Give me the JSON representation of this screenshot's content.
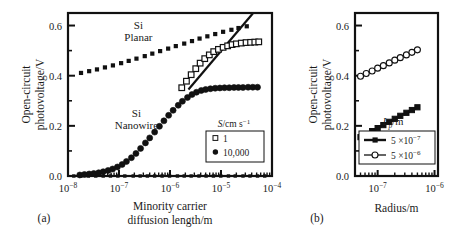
{
  "figure": {
    "panel_a_caption": "(a)",
    "panel_b_caption": "(b)"
  },
  "chart_data": [
    {
      "id": "panel-a",
      "type": "line",
      "title": "",
      "xlabel": "Minority carrier diffusion length/m",
      "xlabel_line1": "Minority carrier",
      "xlabel_line2": "diffusion length/m",
      "ylabel": "Open-circuit photovoltage/V",
      "ylabel_line1": "Open-circuit",
      "ylabel_line2": "photovoltage/V",
      "xscale": "log",
      "xlim": [
        1e-08,
        0.0001
      ],
      "ylim": [
        0.0,
        0.65
      ],
      "grid": false,
      "xticklabels": [
        "10−8",
        "10−7",
        "10−6",
        "10−5",
        "10−4"
      ],
      "xtickvalues": [
        1e-08,
        1e-07,
        1e-06,
        1e-05,
        0.0001
      ],
      "yticklabels": [
        "0.0",
        "0.2",
        "0.4",
        "0.6"
      ],
      "ytickvalues": [
        0.0,
        0.2,
        0.4,
        0.6
      ],
      "yminorticks": [
        0.1,
        0.3,
        0.5
      ],
      "annotations": [
        {
          "text_line1": "Si",
          "text_line2": "Planar",
          "x": 2.4e-07,
          "y": 0.585
        },
        {
          "text_line1": "Si",
          "text_line2": "Nanowire",
          "x": 2.2e-07,
          "y": 0.235
        }
      ],
      "legend": {
        "title": "S/cm s−1",
        "title_base": "S/cm s",
        "title_exp": "−1",
        "position": "lower-right",
        "entries": [
          {
            "label": "1",
            "marker": "open-square"
          },
          {
            "label": "10,000",
            "marker": "filled-circle"
          }
        ]
      },
      "series": [
        {
          "name": "Si Planar",
          "marker": "small-filled-square",
          "line": "none",
          "x": [
            1.8e-08,
            2.6e-08,
            3.7e-08,
            5.3e-08,
            7.6e-08,
            1.1e-07,
            1.55e-07,
            2.2e-07,
            3.2e-07,
            4.5e-07,
            6.4e-07,
            9.2e-07,
            1.3e-06,
            1.9e-06,
            2.7e-06,
            3.8e-06,
            5.4e-06,
            7.7e-06,
            1.1e-05,
            1.6e-05,
            2.2e-05,
            3.2e-05
          ],
          "y": [
            0.411,
            0.418,
            0.425,
            0.433,
            0.441,
            0.45,
            0.459,
            0.468,
            0.478,
            0.488,
            0.498,
            0.508,
            0.518,
            0.528,
            0.538,
            0.548,
            0.557,
            0.566,
            0.575,
            0.583,
            0.59,
            0.597
          ]
        },
        {
          "name": "S = 1",
          "marker": "open-square",
          "line": "none",
          "x": [
            1.7e-06,
            2.1e-06,
            2.6e-06,
            3.2e-06,
            3.9e-06,
            4.8e-06,
            5.9e-06,
            7.2e-06,
            8.9e-06,
            1.1e-05,
            1.35e-05,
            1.65e-05,
            2e-05,
            2.5e-05,
            3.1e-05,
            3.8e-05,
            4.6e-05,
            5.5e-05
          ],
          "y": [
            0.352,
            0.378,
            0.404,
            0.428,
            0.45,
            0.468,
            0.483,
            0.496,
            0.505,
            0.513,
            0.519,
            0.524,
            0.527,
            0.53,
            0.532,
            0.533,
            0.534,
            0.535
          ]
        },
        {
          "name": "S = 10,000",
          "marker": "filled-circle",
          "line": "none",
          "x": [
            1.7e-08,
            2.1e-08,
            2.6e-08,
            3.2e-08,
            4e-08,
            4.9e-08,
            6.1e-08,
            7.5e-08,
            9.3e-08,
            1.15e-07,
            1.4e-07,
            1.75e-07,
            2.15e-07,
            2.65e-07,
            3.3e-07,
            4e-07,
            5e-07,
            6.2e-07,
            7.6e-07,
            9.4e-07,
            1.15e-06,
            1.45e-06,
            1.75e-06,
            2.2e-06,
            2.7e-06,
            3.3e-06,
            4.1e-06,
            5e-06,
            6.2e-06,
            7.7e-06,
            9.5e-06,
            1.17e-05,
            1.45e-05,
            1.8e-05,
            2.2e-05,
            2.7e-05,
            3.4e-05,
            4.2e-05,
            5.2e-05
          ],
          "y": [
            0.004,
            0.006,
            0.008,
            0.01,
            0.013,
            0.017,
            0.022,
            0.028,
            0.036,
            0.046,
            0.058,
            0.073,
            0.09,
            0.11,
            0.132,
            0.152,
            0.175,
            0.198,
            0.22,
            0.242,
            0.262,
            0.282,
            0.298,
            0.313,
            0.325,
            0.334,
            0.341,
            0.345,
            0.348,
            0.35,
            0.351,
            0.352,
            0.352,
            0.353,
            0.353,
            0.353,
            0.354,
            0.354,
            0.354
          ]
        },
        {
          "name": "ideal-line",
          "marker": "none",
          "line": "solid",
          "x": [
            2.3e-06,
            4.2e-05
          ],
          "y": [
            0.345,
            0.648
          ]
        },
        {
          "name": "baseline",
          "marker": "small-filled-square",
          "line": "none",
          "x": [
            1.3e-08,
            1.8e-08,
            2.5e-08,
            3.5e-08,
            4.9e-08,
            6.8e-08,
            9.5e-08,
            1.3e-07,
            1.9e-07,
            2.6e-07,
            3.6e-07,
            5e-07,
            7e-07,
            9.8e-07,
            1.4e-06,
            1.9e-06,
            2.6e-06,
            3.7e-06,
            5.1e-06,
            7.1e-06,
            9.9e-06,
            1.4e-05,
            1.9e-05,
            2.7e-05,
            3.7e-05,
            5.2e-05,
            7.2e-05
          ],
          "y": [
            0.0,
            0.0,
            0.0,
            0.0,
            0.0,
            0.0,
            0.0,
            0.0,
            0.0,
            0.0,
            0.0,
            0.0,
            0.0,
            0.0,
            0.0,
            0.0,
            0.0,
            0.0,
            0.0,
            0.0,
            0.0,
            0.0,
            0.0,
            0.0,
            0.0,
            0.0,
            0.0
          ]
        }
      ]
    },
    {
      "id": "panel-b",
      "type": "line",
      "title": "",
      "xlabel": "Radius/m",
      "ylabel": "Open-circuit photovoltage/V",
      "ylabel_line1": "Open-circuit",
      "ylabel_line2": "photovoltage/V",
      "xscale": "log",
      "xlim": [
        4e-08,
        1.15e-06
      ],
      "ylim": [
        0.0,
        0.65
      ],
      "grid": false,
      "xticklabels": [
        "10−7",
        "10−6"
      ],
      "xtickvalues": [
        1e-07,
        1e-06
      ],
      "yticklabels": [
        "0.0",
        "0.2",
        "0.4",
        "0.6"
      ],
      "ytickvalues": [
        0.0,
        0.2,
        0.4,
        0.6
      ],
      "yminorticks": [
        0.1,
        0.3,
        0.5
      ],
      "legend": {
        "title": "Lp/m",
        "title_base": "L",
        "title_sub": "p",
        "title_suffix": "/m",
        "position": "lower-center",
        "entries": [
          {
            "label": "5 ×10−7",
            "marker": "filled-square",
            "base": "5 ×10",
            "exp": "−7"
          },
          {
            "label": "5 ×10−6",
            "marker": "open-circle",
            "base": "5 ×10",
            "exp": "−6"
          }
        ]
      },
      "series": [
        {
          "name": "5 ×10−6",
          "marker": "open-circle",
          "line": "solid-thin",
          "x": [
            5e-08,
            6.3e-08,
            8e-08,
            1e-07,
            1.26e-07,
            1.6e-07,
            2e-07,
            2.5e-07,
            3.2e-07,
            4e-07,
            5e-07
          ],
          "y": [
            0.398,
            0.409,
            0.419,
            0.43,
            0.44,
            0.451,
            0.462,
            0.472,
            0.483,
            0.493,
            0.503
          ]
        },
        {
          "name": "5 ×10−7",
          "marker": "filled-square",
          "line": "solid-thin",
          "x": [
            5e-08,
            6.3e-08,
            8e-08,
            1e-07,
            1.26e-07,
            1.6e-07,
            2e-07,
            2.5e-07,
            3.2e-07,
            4e-07,
            5e-07
          ],
          "y": [
            0.155,
            0.167,
            0.179,
            0.191,
            0.203,
            0.216,
            0.228,
            0.24,
            0.252,
            0.263,
            0.274
          ]
        }
      ]
    }
  ]
}
